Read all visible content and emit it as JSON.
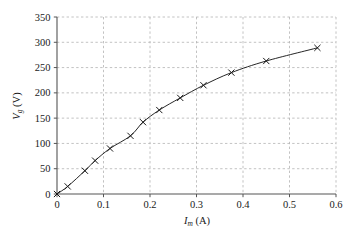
{
  "chart_data": {
    "type": "line",
    "title": "",
    "subtitle": "",
    "xlabel": "I_m (A)",
    "xlabel_parts": {
      "symbol": "I",
      "subscript": "m",
      "unit": "(A)"
    },
    "ylabel": "V_g (V)",
    "ylabel_parts": {
      "symbol": "V",
      "subscript": "g",
      "unit": "(V)"
    },
    "xlim": [
      0,
      0.6
    ],
    "ylim": [
      0,
      350
    ],
    "xticks": [
      0,
      0.1,
      0.2,
      0.3,
      0.4,
      0.5,
      0.6
    ],
    "xtick_labels": [
      "0",
      "0.1",
      "0.2",
      "0.3",
      "0.4",
      "0.5",
      "0.6"
    ],
    "yticks": [
      0,
      50,
      100,
      150,
      200,
      250,
      300,
      350
    ],
    "ytick_labels": [
      "0",
      "50",
      "100",
      "150",
      "200",
      "250",
      "300",
      "350"
    ],
    "grid": true,
    "grid_style": "dashed",
    "grid_color": "#b3b3b3",
    "legend": null,
    "legend_position": "none",
    "marker": "x",
    "marker_color": "#1a1a1a",
    "line_color": "#1a1a1a",
    "series": [
      {
        "name": "measured",
        "x": [
          0.0,
          0.023,
          0.06,
          0.082,
          0.114,
          0.158,
          0.185,
          0.22,
          0.265,
          0.315,
          0.375,
          0.45,
          0.56
        ],
        "y": [
          0,
          15,
          46,
          66,
          90,
          115,
          142,
          166,
          190,
          215,
          240,
          263,
          289
        ]
      }
    ]
  },
  "axes": {
    "x_axis_name": "current-axis",
    "y_axis_name": "voltage-axis"
  }
}
